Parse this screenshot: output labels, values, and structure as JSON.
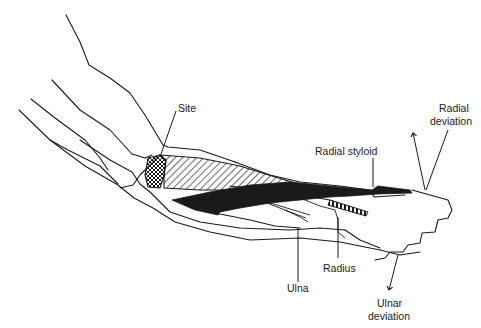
{
  "diagram": {
    "type": "anatomical line drawing",
    "labels": {
      "site": "Site",
      "radial_styloid": "Radial styloid",
      "radial_deviation_1": "Radial",
      "radial_deviation_2": "deviation",
      "radius": "Radius",
      "ulna": "Ulna",
      "ulnar_deviation_1": "Ulnar",
      "ulnar_deviation_2": "deviation"
    },
    "colors": {
      "line": "#1a1a1a",
      "background": "#ffffff"
    }
  }
}
